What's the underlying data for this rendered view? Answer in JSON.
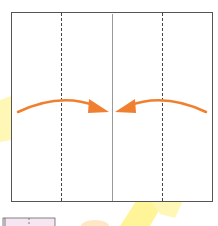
{
  "diagram": {
    "type": "fold-instruction",
    "paper": {
      "x": 11,
      "y": 12,
      "width": 201,
      "height": 189,
      "border_color": "#555555",
      "fill": "#ffffff"
    },
    "creases": [
      {
        "kind": "valley-fold-dashed",
        "x": 61
      },
      {
        "kind": "center-crease-solid",
        "x": 112
      },
      {
        "kind": "valley-fold-dashed",
        "x": 162
      }
    ],
    "arrows": [
      {
        "direction": "right",
        "from_x": 18,
        "to_x": 108,
        "y": 110,
        "color": "#f08030"
      },
      {
        "direction": "left",
        "from_x": 206,
        "to_x": 116,
        "y": 110,
        "color": "#f08030"
      }
    ],
    "colors": {
      "arrow": "#f08030",
      "dash": "#444444",
      "center_line": "#999999",
      "watermark_yellow": "#fff176",
      "watermark_peach": "#ffe0b2",
      "next_step_fill": "#f6e6f2"
    }
  }
}
